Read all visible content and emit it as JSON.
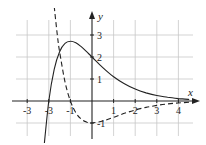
{
  "chart_data": {
    "type": "line",
    "title": "",
    "xlabel": "x",
    "ylabel": "y",
    "xlim": [
      -3.7,
      4.9
    ],
    "ylim": [
      -1.5,
      3.9
    ],
    "grid": true,
    "legend": null,
    "x_ticks": [
      -3,
      -2,
      -1,
      1,
      2,
      3,
      4
    ],
    "x_tick_labels": [
      "-3",
      "-3",
      "-1",
      "1",
      "2",
      "3",
      "4"
    ],
    "y_ticks": [
      3,
      2,
      1,
      -1
    ],
    "y_tick_labels": [
      "3",
      "2",
      "1",
      "-1"
    ],
    "series": [
      {
        "name": "f(x) = (x+2)e^(-x)",
        "style": "solid",
        "x": [
          -2.25,
          -2.0,
          -1.75,
          -1.5,
          -1.25,
          -1.0,
          -0.75,
          -0.5,
          -0.25,
          0.0,
          0.5,
          1.0,
          1.5,
          2.0,
          2.5,
          3.0,
          3.5,
          4.0,
          4.5
        ],
        "y": [
          -2.37,
          0.0,
          1.44,
          2.24,
          2.62,
          2.72,
          2.65,
          2.47,
          2.24,
          2.0,
          1.52,
          1.1,
          0.78,
          0.54,
          0.37,
          0.25,
          0.17,
          0.11,
          0.07
        ]
      },
      {
        "name": "f'(x) = -(x+1)e^(-x)",
        "style": "dashed",
        "x": [
          -1.75,
          -1.6,
          -1.5,
          -1.25,
          -1.0,
          -0.75,
          -0.5,
          -0.25,
          0.0,
          0.5,
          1.0,
          1.5,
          2.0,
          2.5,
          3.0,
          3.5,
          4.0,
          4.5
        ],
        "y": [
          4.31,
          2.97,
          2.24,
          0.87,
          0.0,
          -0.53,
          -0.82,
          -0.96,
          -1.0,
          -0.91,
          -0.74,
          -0.56,
          -0.41,
          -0.29,
          -0.2,
          -0.13,
          -0.09,
          -0.06
        ]
      }
    ]
  },
  "axes": {
    "x_label": "x",
    "y_label": "y"
  }
}
